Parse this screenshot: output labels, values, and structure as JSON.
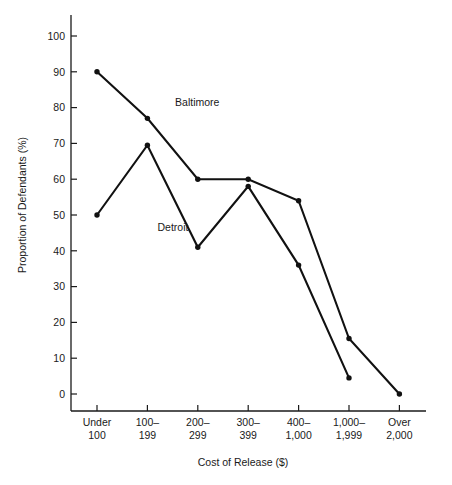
{
  "chart_data": {
    "type": "line",
    "title": "",
    "xlabel": "Cost of Release ($)",
    "ylabel": "Proportion of Defendants (%)",
    "categories": [
      "Under\n100",
      "100–\n199",
      "200–\n299",
      "300–\n399",
      "400–\n1,000",
      "1,000–\n1,999",
      "Over\n2,000"
    ],
    "category_lines": [
      [
        "Under",
        "100"
      ],
      [
        "100–",
        "199"
      ],
      [
        "200–",
        "299"
      ],
      [
        "300–",
        "399"
      ],
      [
        "400–",
        "1,000"
      ],
      [
        "1,000–",
        "1,999"
      ],
      [
        "Over",
        "2,000"
      ]
    ],
    "ylim": [
      0,
      100
    ],
    "yticks": [
      0,
      10,
      20,
      30,
      40,
      50,
      60,
      70,
      80,
      90,
      100
    ],
    "ytick_labels": [
      "0",
      "10",
      "20",
      "30",
      "40",
      "50",
      "60",
      "70",
      "80",
      "90",
      "100"
    ],
    "grid": false,
    "legend_position": "inline-annotation",
    "series": [
      {
        "name": "Baltimore",
        "label_x_index": 1.55,
        "label_y": 80.5,
        "values": [
          90,
          77,
          60,
          60,
          54,
          15.5,
          0
        ]
      },
      {
        "name": "Detroit",
        "label_x_index": 1.2,
        "label_y": 45.5,
        "values": [
          50,
          69.5,
          41,
          58,
          36,
          4.5,
          null
        ]
      }
    ]
  },
  "figure": {
    "background_color": "#ffffff",
    "line_color": "#111111",
    "text_color": "#1a1a1a"
  }
}
